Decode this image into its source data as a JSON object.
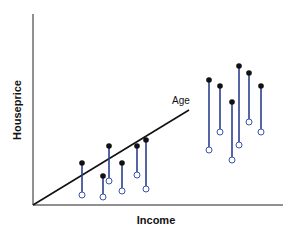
{
  "chart_data": {
    "type": "scatter",
    "title": "",
    "xlabel": "Income",
    "ylabel": "Houseprice",
    "annotations": [
      {
        "text": "Age",
        "note": "label on regression line"
      }
    ],
    "trend_line": {
      "label": "Age",
      "x1": 33,
      "y1": 205,
      "x2": 189,
      "y2": 110
    },
    "pairs": [
      {
        "x": 82,
        "top": 163,
        "bottom": 195
      },
      {
        "x": 103,
        "top": 176,
        "bottom": 197
      },
      {
        "x": 109,
        "top": 146,
        "bottom": 181
      },
      {
        "x": 122,
        "top": 163,
        "bottom": 191
      },
      {
        "x": 137,
        "top": 146,
        "bottom": 175
      },
      {
        "x": 146,
        "top": 140,
        "bottom": 189
      },
      {
        "x": 209,
        "top": 80,
        "bottom": 150
      },
      {
        "x": 220,
        "top": 86,
        "bottom": 132
      },
      {
        "x": 232,
        "top": 102,
        "bottom": 160
      },
      {
        "x": 239,
        "top": 66,
        "bottom": 145
      },
      {
        "x": 249,
        "top": 73,
        "bottom": 122
      },
      {
        "x": 261,
        "top": 86,
        "bottom": 132
      }
    ],
    "legend": [],
    "grid": false
  },
  "labels": {
    "x_axis": "Income",
    "y_axis": "Houseprice",
    "line": "Age"
  },
  "colors": {
    "segment": "#2b3f8f",
    "observed": "#111111",
    "predicted": "#3b52b0"
  }
}
